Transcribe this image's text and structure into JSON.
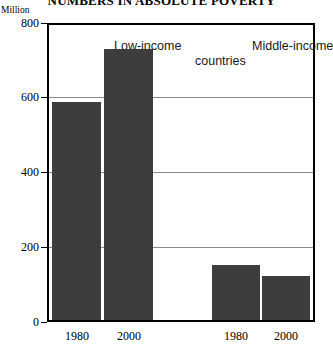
{
  "chart_data": {
    "type": "bar",
    "title": "NUMBERS IN ABSOLUTE POVERTY",
    "subtitle": "",
    "xlabel": "",
    "ylabel": "Million",
    "ylim": [
      0,
      800
    ],
    "yticks": [
      0,
      200,
      400,
      600,
      800
    ],
    "ytick_labels": [
      "0",
      "200",
      "400",
      "600",
      "800"
    ],
    "grid": true,
    "legend": "none",
    "categories": [
      "1980",
      "2000",
      "1980",
      "2000"
    ],
    "values": [
      590,
      735,
      150,
      120
    ],
    "groups": [
      {
        "name": "Low-income countries",
        "heading_line1": "Low-income",
        "categories": [
          "1980",
          "2000"
        ],
        "values": [
          590,
          735
        ]
      },
      {
        "name": "Middle-income countries",
        "heading_line1": "Middle-income",
        "categories": [
          "1980",
          "2000"
        ],
        "values": [
          150,
          120
        ]
      }
    ],
    "shared_heading_line2": "countries",
    "bar_color": "#3d3d3d",
    "gridline_color": "#8a8a8a",
    "axis_color": "#000000",
    "background_color": "#ffffff"
  },
  "axis": {
    "unit_label": "Million",
    "tick_800": "800",
    "tick_600": "600",
    "tick_400": "400",
    "tick_200": "200",
    "tick_0": "0"
  },
  "headings": {
    "low_income": "Low-income",
    "middle_income": "Middle-income",
    "countries": "countries"
  },
  "x_labels": {
    "low_1980": "1980",
    "low_2000": "2000",
    "mid_1980": "1980",
    "mid_2000": "2000"
  }
}
